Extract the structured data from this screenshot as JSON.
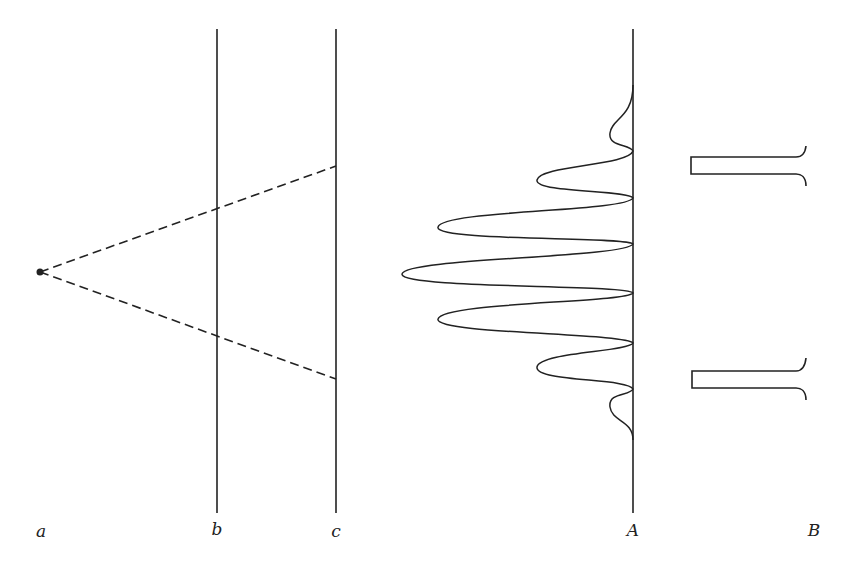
{
  "diagram": {
    "title": "",
    "colors": {
      "stroke": "#222222",
      "background": "#ffffff"
    },
    "source": {
      "id": "a",
      "x": 40,
      "y": 272
    },
    "screens": [
      {
        "id": "b",
        "x": 217,
        "y_top": 29,
        "y_bottom": 513
      },
      {
        "id": "c",
        "x": 336,
        "y_top": 29,
        "y_bottom": 513
      },
      {
        "id": "A",
        "x": 633,
        "y_top": 29,
        "y_bottom": 513
      }
    ],
    "rays": [
      {
        "from": "a",
        "to": {
          "x": 336,
          "y": 166
        },
        "style": "dashed"
      },
      {
        "from": "a",
        "to": {
          "x": 336,
          "y": 379
        },
        "style": "dashed"
      }
    ],
    "interference_peaks": [
      {
        "y": 135,
        "x_extent": 610
      },
      {
        "y": 180,
        "x_extent": 537
      },
      {
        "y": 227,
        "x_extent": 438
      },
      {
        "y": 272,
        "x_extent": 402
      },
      {
        "y": 319,
        "x_extent": 438
      },
      {
        "y": 367,
        "x_extent": 537
      },
      {
        "y": 407,
        "x_extent": 610
      }
    ],
    "slit_pattern_B": [
      {
        "y_top": 157,
        "y_bottom": 174,
        "x_left": 691,
        "x_right": 808
      },
      {
        "y_top": 371,
        "y_bottom": 388,
        "x_left": 692,
        "x_right": 808
      }
    ]
  },
  "labels": {
    "a": "a",
    "b": "b",
    "c": "c",
    "A": "A",
    "B": "B"
  }
}
